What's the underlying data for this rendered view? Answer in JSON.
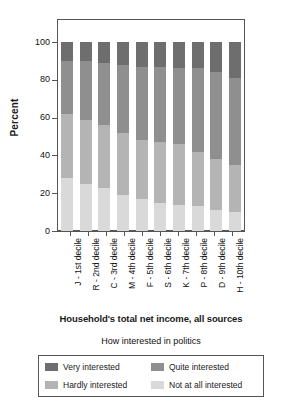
{
  "chart_data": {
    "type": "bar",
    "subtype": "stacked-percentage-column",
    "title": "",
    "xlabel": "Household's total net income, all sources",
    "ylabel": "Percent",
    "ylim": [
      0,
      100
    ],
    "yticks": [
      0,
      20,
      40,
      60,
      80,
      100
    ],
    "grid": false,
    "legend_title": "How interested in politics",
    "legend_position": "bottom",
    "categories": [
      "J - 1st decile",
      "R - 2nd decile",
      "C - 3rd decile",
      "M - 4th decile",
      "F - 5th decile",
      "S - 6th decile",
      "K - 7th decile",
      "P - 8th decile",
      "D - 9th decile",
      "H - 10th decile"
    ],
    "series": [
      {
        "name": "Very interested",
        "color": "#6e6e6e",
        "values": [
          10,
          10,
          11,
          12,
          13,
          13,
          14,
          14,
          16,
          19
        ]
      },
      {
        "name": "Quite interested",
        "color": "#8f8f8f",
        "values": [
          28,
          31,
          33,
          36,
          39,
          40,
          40,
          44,
          46,
          46
        ]
      },
      {
        "name": "Hardly interested",
        "color": "#b4b4b4",
        "values": [
          34,
          34,
          33,
          33,
          31,
          32,
          32,
          29,
          27,
          25
        ]
      },
      {
        "name": "Not at all interested",
        "color": "#d9d9d9",
        "values": [
          28,
          25,
          23,
          19,
          17,
          15,
          14,
          13,
          11,
          10
        ]
      }
    ],
    "stack_order_bottom_to_top": [
      "Not at all interested",
      "Hardly interested",
      "Quite interested",
      "Very interested"
    ]
  },
  "axis": {
    "y_title": "Percent",
    "y_tick_labels": [
      "100",
      "80",
      "60",
      "40",
      "20",
      "0"
    ],
    "x_title": "Household's total net income, all sources"
  },
  "legend": {
    "title": "How interested in politics",
    "items": [
      {
        "label": "Very interested",
        "color": "#6e6e6e"
      },
      {
        "label": "Quite interested",
        "color": "#8f8f8f"
      },
      {
        "label": "Hardly interested",
        "color": "#b4b4b4"
      },
      {
        "label": "Not at all interested",
        "color": "#d9d9d9"
      }
    ]
  }
}
